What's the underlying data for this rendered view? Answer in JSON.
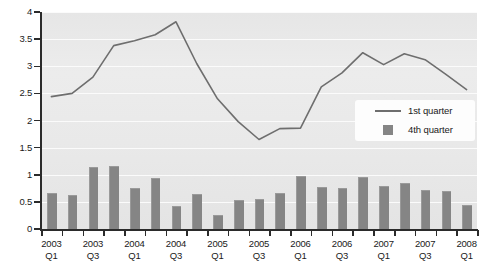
{
  "chart_data": {
    "type": "bar",
    "title": "",
    "subtitle": "",
    "xlabel": "",
    "ylabel": "",
    "ylim": [
      0,
      4
    ],
    "ytick_labels": [
      "0",
      "0.5",
      "1",
      "1.5",
      "2",
      "2.5",
      "3",
      "3.5",
      "4"
    ],
    "ytick_values": [
      0,
      0.5,
      1,
      1.5,
      2,
      2.5,
      3,
      3.5,
      4
    ],
    "grid": true,
    "legend_position": "inside-right",
    "categories": [
      "2003 Q1",
      "2003 Q2",
      "2003 Q3",
      "2003 Q4",
      "2004 Q1",
      "2004 Q2",
      "2004 Q3",
      "2004 Q4",
      "2005 Q1",
      "2005 Q2",
      "2005 Q3",
      "2005 Q4",
      "2006 Q1",
      "2006 Q2",
      "2006 Q3",
      "2006 Q4",
      "2007 Q1",
      "2007 Q2",
      "2007 Q3",
      "2007 Q4",
      "2008 Q1"
    ],
    "xtick_labels": [
      {
        "year": "2003",
        "quarter": "Q1",
        "index": 0
      },
      {
        "year": "2003",
        "quarter": "Q3",
        "index": 2
      },
      {
        "year": "2004",
        "quarter": "Q1",
        "index": 4
      },
      {
        "year": "2004",
        "quarter": "Q3",
        "index": 6
      },
      {
        "year": "2005",
        "quarter": "Q1",
        "index": 8
      },
      {
        "year": "2005",
        "quarter": "Q3",
        "index": 10
      },
      {
        "year": "2006",
        "quarter": "Q1",
        "index": 12
      },
      {
        "year": "2006",
        "quarter": "Q3",
        "index": 14
      },
      {
        "year": "2007",
        "quarter": "Q1",
        "index": 16
      },
      {
        "year": "2007",
        "quarter": "Q3",
        "index": 18
      },
      {
        "year": "2008",
        "quarter": "Q1",
        "index": 20
      }
    ],
    "series": [
      {
        "name": "1st quarter",
        "type": "line",
        "color": "#6e6e6e",
        "values": [
          2.44,
          2.5,
          2.8,
          3.38,
          3.47,
          3.58,
          3.82,
          3.05,
          2.4,
          1.98,
          1.65,
          1.85,
          1.86,
          2.62,
          2.88,
          3.25,
          3.03,
          3.23,
          3.12,
          2.85,
          2.57
        ]
      },
      {
        "name": "4th quarter",
        "type": "bar",
        "color": "#858585",
        "values": [
          0.66,
          0.62,
          1.15,
          1.16,
          0.75,
          0.95,
          0.42,
          0.65,
          0.25,
          0.53,
          0.55,
          0.67,
          0.97,
          0.78,
          0.75,
          0.96,
          0.8,
          0.85,
          0.72,
          0.7,
          0.44
        ]
      }
    ]
  },
  "legend": {
    "items": [
      {
        "label": "1st quarter",
        "marker": "line"
      },
      {
        "label": "4th quarter",
        "marker": "square"
      }
    ]
  },
  "colors": {
    "line": "#6e6e6e",
    "bar": "#858585",
    "plot_background": "#e9e9e9",
    "gridline": "#fbfbfb",
    "axis": "#2b2b2b",
    "text": "#1a1a1a"
  }
}
